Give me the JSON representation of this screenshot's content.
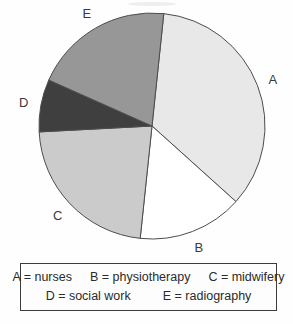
{
  "chart_data": {
    "type": "pie",
    "title": "",
    "slices": [
      {
        "label": "A",
        "name": "nurses",
        "percent": 35,
        "color": "#e8e8e8"
      },
      {
        "label": "B",
        "name": "physiotherapy",
        "percent": 15,
        "color": "#ffffff"
      },
      {
        "label": "C",
        "name": "midwifery",
        "percent": 22.5,
        "color": "#cbcbcb"
      },
      {
        "label": "D",
        "name": "social work",
        "percent": 7.5,
        "color": "#3f3f3f"
      },
      {
        "label": "E",
        "name": "radiography",
        "percent": 20,
        "color": "#979797"
      }
    ],
    "start_angle_deg": 84,
    "direction": "clockwise",
    "stroke_color": "#4d4d4d",
    "legend_position": "bottom-box"
  },
  "legend": {
    "rows": [
      [
        "A = nurses",
        "B = physiotherapy",
        "C = midwifery"
      ],
      [
        "D = social work",
        "E = radiography"
      ]
    ]
  }
}
